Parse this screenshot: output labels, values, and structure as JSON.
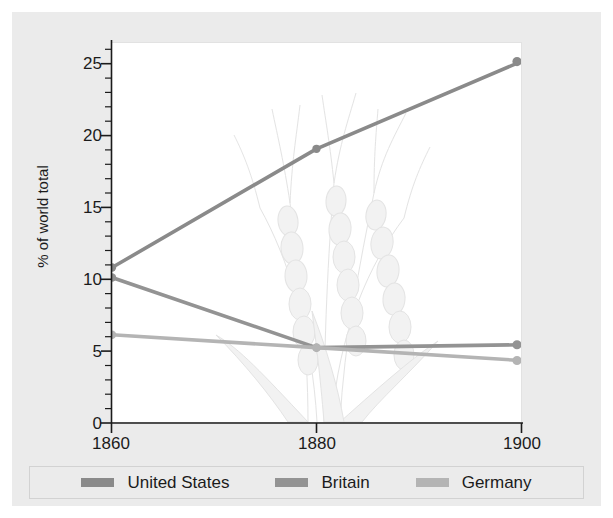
{
  "chart_data": {
    "type": "line",
    "title": "",
    "subtitle": "",
    "xlabel": "",
    "ylabel": "% of world total",
    "x": [
      1860,
      1880,
      1900
    ],
    "xticks": [
      "1860",
      "1880",
      "1900"
    ],
    "xlim": [
      1860,
      1900
    ],
    "ylim": [
      0,
      26.5
    ],
    "yticks": [
      "0",
      "5",
      "10",
      "15",
      "20",
      "25"
    ],
    "ytick_values": [
      0,
      5,
      10,
      15,
      20,
      25
    ],
    "minor_tick_step": 1,
    "grid": false,
    "legend_position": "bottom",
    "series": [
      {
        "name": "United States",
        "color": "#8a8a8a",
        "values": [
          10.8,
          19.1,
          25.2
        ],
        "markers": true
      },
      {
        "name": "Britain",
        "color": "#939393",
        "values": [
          10.1,
          5.2,
          5.4
        ],
        "markers": true
      },
      {
        "name": "Germany",
        "color": "#b4b4b4",
        "values": [
          6.1,
          5.2,
          4.3
        ],
        "markers": true
      }
    ],
    "annotations": [
      {
        "name": "wheat-watermark",
        "description": "faint line drawing of wheat stalks"
      }
    ]
  },
  "legend": {
    "items": [
      {
        "label": "United States",
        "color": "#8a8a8a"
      },
      {
        "label": "Britain",
        "color": "#939393"
      },
      {
        "label": "Germany",
        "color": "#b4b4b4"
      }
    ]
  },
  "axes": {
    "y_title": "% of world total",
    "y_tick_labels": [
      "25",
      "20",
      "15",
      "10",
      "5",
      "0"
    ],
    "x_tick_labels": [
      "1860",
      "1880",
      "1900"
    ]
  },
  "colors": {
    "figure_background": "#ebebeb",
    "plot_background": "#ffffff",
    "axis": "#1b1b1b",
    "series_us": "#8a8a8a",
    "series_britain": "#939393",
    "series_germany": "#b4b4b4"
  }
}
